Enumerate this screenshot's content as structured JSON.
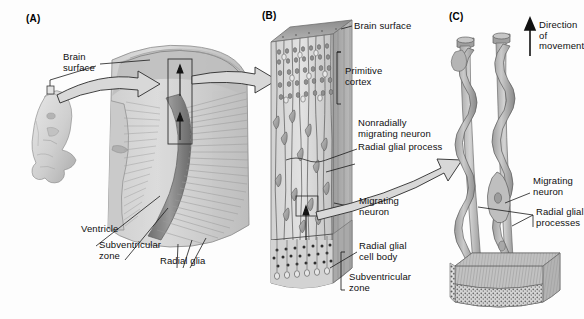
{
  "figure": {
    "background": "#fdfdfd",
    "ink": "#1a1a1a"
  },
  "panels": [
    {
      "id": "A",
      "letter": "(A)"
    },
    {
      "id": "B",
      "letter": "(B)"
    },
    {
      "id": "C",
      "letter": "(C)"
    }
  ],
  "labels": {
    "a_brain_surface": "Brain\nsurface",
    "a_ventricle": "Ventricle",
    "a_subventricular_zone": "Subventricular\nzone",
    "a_radial_glia": "Radial glia",
    "b_brain_surface": "Brain surface",
    "b_primitive_cortex": "Primitive\ncortex",
    "b_nonradially_migrating_neuron": "Nonradially\nmigrating neuron",
    "b_radial_glial_process": "Radial glial process",
    "b_migrating_neuron": "Migrating\nneuron",
    "b_radial_glial_cell_body": "Radial glial\ncell body",
    "b_subventricular_zone": "Subventricular\nzone",
    "c_direction_of_movement": "Direction of\nmovement",
    "c_migrating_neuron": "Migrating\nneuron",
    "c_radial_glial_processes": "Radial glial\nprocesses"
  },
  "icons": {
    "up_arrow": "direction-arrow-up",
    "block_arrow_a_to_brain": "block-arrow-right",
    "block_arrow_brain_to_b": "block-arrow-right",
    "block_arrow_b_to_c": "curved-block-arrow-right"
  },
  "colors": {
    "tissue_light": "#d9d9d9",
    "tissue_mid": "#bdbdbd",
    "tissue_dark": "#8e8e8e",
    "ventricle": "#7a7a7a",
    "arrow_fill": "#d8d8d8",
    "outline": "#2b2b2b"
  }
}
